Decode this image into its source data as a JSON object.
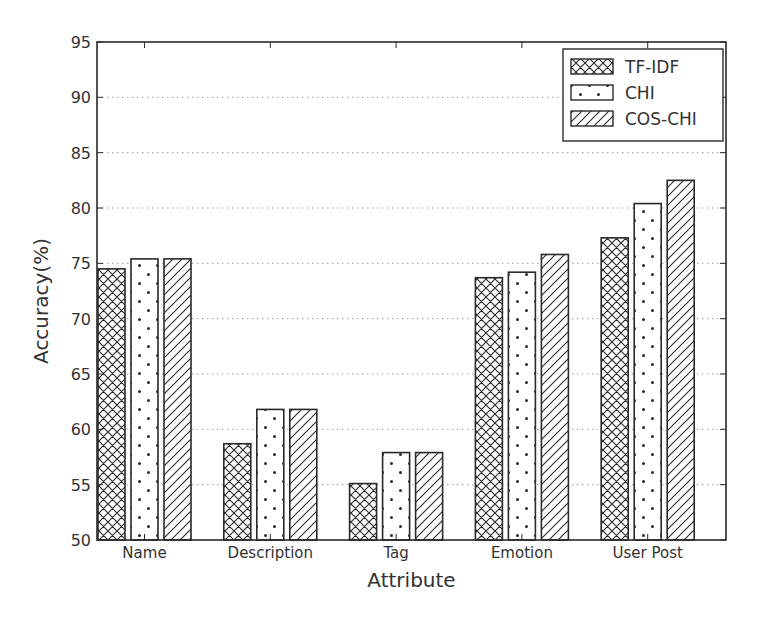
{
  "chart_data": {
    "type": "bar",
    "title": "",
    "xlabel": "Attribute",
    "ylabel": "Accuracy(%)",
    "ylim": [
      50,
      95
    ],
    "yticks": [
      50,
      55,
      60,
      65,
      70,
      75,
      80,
      85,
      90,
      95
    ],
    "grid": "horizontal dotted",
    "legend_position": "upper right",
    "categories": [
      "Name",
      "Description",
      "Tag",
      "Emotion",
      "User Post"
    ],
    "series": [
      {
        "name": "TF-IDF",
        "pattern": "crosshatch",
        "values": [
          74.5,
          58.7,
          55.1,
          73.7,
          77.3
        ]
      },
      {
        "name": "CHI",
        "pattern": "dots",
        "values": [
          75.4,
          61.8,
          57.9,
          74.2,
          80.4
        ]
      },
      {
        "name": "COS-CHI",
        "pattern": "diagonal",
        "values": [
          75.4,
          61.8,
          57.9,
          75.8,
          82.5
        ]
      }
    ]
  },
  "colors": {
    "axis": "#2a2a2a",
    "grid": "#9a9a9a",
    "bar_fill": "#ffffff",
    "pattern": "#2a2a2a"
  }
}
